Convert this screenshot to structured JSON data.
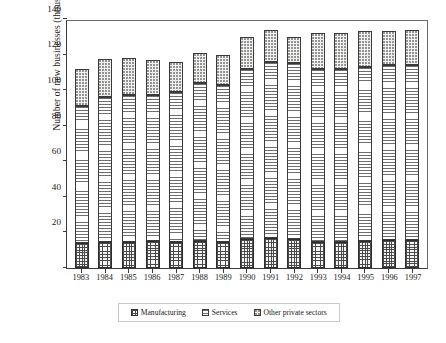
{
  "chart_data": {
    "type": "bar",
    "stacked": true,
    "title": "",
    "xlabel": "",
    "ylabel": "Number of new businesses (thousands)",
    "ylim": [
      0,
      140
    ],
    "yticks": [
      0,
      20,
      40,
      60,
      80,
      100,
      120,
      140
    ],
    "ytick_labels": [
      "",
      "20",
      "40",
      "60",
      "80",
      "100",
      "120",
      "140"
    ],
    "grid": false,
    "legend_position": "bottom",
    "categories": [
      "1983",
      "1984",
      "1985",
      "1986",
      "1987",
      "1988",
      "1989",
      "1990",
      "1991",
      "1992",
      "1993",
      "1994",
      "1995",
      "1996",
      "1997"
    ],
    "series": [
      {
        "name": "Manufacturing",
        "pattern": "cross-hatch",
        "values": [
          14,
          14.5,
          14.5,
          15,
          14.5,
          15,
          14.5,
          16.5,
          17,
          16.5,
          14.5,
          14.5,
          15,
          15.5,
          15.5
        ]
      },
      {
        "name": "Services",
        "pattern": "horizontal-hatch",
        "values": [
          77,
          81.5,
          83,
          82.5,
          84.5,
          89,
          88.5,
          95.5,
          99,
          98.5,
          97.5,
          97.5,
          98,
          98.5,
          98.5
        ]
      },
      {
        "name": "Other private sectors",
        "pattern": "dotted",
        "values": [
          21,
          21.5,
          20.5,
          19.5,
          17,
          17,
          17,
          18,
          18,
          15,
          20,
          20,
          20,
          19,
          20
        ]
      }
    ],
    "totals": [
      112,
      117.5,
      118,
      117,
      116,
      121,
      120,
      130,
      134,
      130,
      132,
      132,
      133,
      133,
      134
    ],
    "cumulative_tops": {
      "manufacturing": [
        14,
        14.5,
        14.5,
        15,
        14.5,
        15,
        14.5,
        16.5,
        17,
        16.5,
        14.5,
        14.5,
        15,
        15.5,
        15.5
      ],
      "services": [
        91,
        96,
        97.5,
        97.5,
        99,
        104,
        103,
        112,
        116,
        115,
        112,
        112,
        113,
        114,
        114
      ],
      "other": [
        112,
        117.5,
        118,
        117,
        116,
        121,
        120,
        130,
        134,
        130,
        132,
        132,
        133,
        133,
        134
      ]
    }
  },
  "legend": {
    "items": [
      {
        "label": "Manufacturing"
      },
      {
        "label": "Services"
      },
      {
        "label": "Other private sectors"
      }
    ]
  }
}
